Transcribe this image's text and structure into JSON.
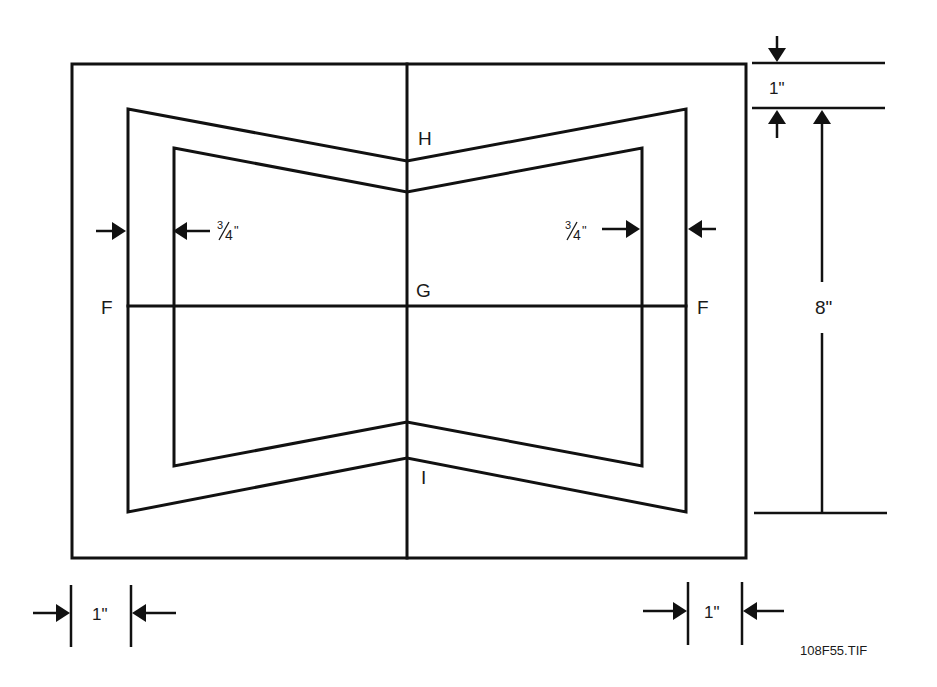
{
  "figure": {
    "id_label": "108F55.TIF",
    "background": "#ffffff",
    "line_color": "#111111"
  },
  "outer_board": {
    "x": 72,
    "y": 64,
    "w": 674,
    "h": 494
  },
  "center_fold_line": {
    "x": 407,
    "y1": 64,
    "y2": 558
  },
  "horizontal_line": {
    "x1": 128,
    "x2": 686,
    "y": 306
  },
  "outer_cut_shape": {
    "points": [
      [
        128,
        109
      ],
      [
        407,
        161
      ],
      [
        686,
        109
      ],
      [
        686,
        512
      ],
      [
        407,
        458
      ],
      [
        128,
        512
      ]
    ]
  },
  "inner_cut_shape": {
    "points": [
      [
        174,
        148
      ],
      [
        407,
        192
      ],
      [
        642,
        148
      ],
      [
        642,
        466
      ],
      [
        407,
        422
      ],
      [
        174,
        466
      ]
    ]
  },
  "labels": {
    "H": "H",
    "G": "G",
    "I": "I",
    "F_left": "F",
    "F_right": "F"
  },
  "dimensions": {
    "top_margin": {
      "label": "1\"",
      "value_in": 1
    },
    "height": {
      "label": "8\"",
      "value_in": 8
    },
    "inset_left": {
      "label_num": "3",
      "label_den": "4",
      "label_suffix": "\"",
      "label": "3/4\"",
      "value_in": 0.75
    },
    "inset_right": {
      "label_num": "3",
      "label_den": "4",
      "label_suffix": "\"",
      "label": "3/4\"",
      "value_in": 0.75
    },
    "bottom_left_margin": {
      "label": "1\"",
      "value_in": 1
    },
    "bottom_right_margin": {
      "label": "1\"",
      "value_in": 1
    }
  }
}
